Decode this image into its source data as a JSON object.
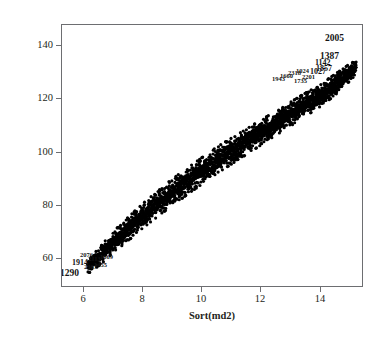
{
  "figure": {
    "background_color": "#ffffff",
    "frame_color": "#6d6e71",
    "point_color": "#000000"
  },
  "axes": {
    "x": {
      "label": "Sort(md2)",
      "ticks": [
        "6",
        "8",
        "10",
        "12",
        "14"
      ],
      "tick_values": [
        6,
        8,
        10,
        12,
        14
      ],
      "range": [
        5.28,
        15.45
      ]
    },
    "y": {
      "label": "Qchisq(((1:n)-(1/2))/n, (3 * k))",
      "ticks": [
        "140",
        "120",
        "100",
        "80",
        "60"
      ],
      "tick_values": [
        140,
        120,
        100,
        80,
        60
      ],
      "range": [
        50.1,
        148.9
      ]
    }
  },
  "point_labels": {
    "upper_right": [
      {
        "text": "2005",
        "x": 263,
        "y": 8,
        "size": "normal"
      },
      {
        "text": "1387",
        "x": 258,
        "y": 26,
        "size": "normal"
      },
      {
        "text": "1142",
        "x": 253,
        "y": 34,
        "size": "small"
      },
      {
        "text": "1857",
        "x": 254,
        "y": 40,
        "size": "small"
      },
      {
        "text": "1027",
        "x": 248,
        "y": 43,
        "size": "small"
      },
      {
        "text": "1024",
        "x": 234,
        "y": 42,
        "size": "tiny"
      },
      {
        "text": "2318",
        "x": 226,
        "y": 44,
        "size": "tiny"
      },
      {
        "text": "1660",
        "x": 218,
        "y": 47,
        "size": "tiny"
      },
      {
        "text": "1943",
        "x": 210,
        "y": 50,
        "size": "tiny"
      },
      {
        "text": "2201",
        "x": 240,
        "y": 48,
        "size": "tiny"
      },
      {
        "text": "1735",
        "x": 232,
        "y": 52,
        "size": "tiny"
      }
    ],
    "lower_left": [
      {
        "text": "1290",
        "x": -2,
        "y": 243,
        "size": "normal"
      },
      {
        "text": "1914",
        "x": 10,
        "y": 234,
        "size": "small"
      },
      {
        "text": "2076",
        "x": 18,
        "y": 226,
        "size": "tiny"
      },
      {
        "text": "2113",
        "x": 26,
        "y": 230,
        "size": "tiny"
      },
      {
        "text": "1455",
        "x": 32,
        "y": 236,
        "size": "tiny"
      },
      {
        "text": "2307",
        "x": 22,
        "y": 238,
        "size": "tiny"
      },
      {
        "text": "1669",
        "x": 38,
        "y": 228,
        "size": "tiny"
      }
    ]
  },
  "chart_data": {
    "type": "scatter",
    "title": "",
    "xlabel": "Sort(md2)",
    "ylabel": "Qchisq(((1:n)-(1/2))/n, (3 * k))",
    "xlim": [
      5.28,
      15.45
    ],
    "ylim": [
      50.1,
      148.9
    ],
    "grid": false,
    "legend": null,
    "n_points": 2400,
    "marker": "filled-circle",
    "marker_size_px": 3.2,
    "band": {
      "spine_x": [
        6.15,
        6.6,
        7.0,
        7.5,
        8.0,
        8.5,
        9.0,
        9.5,
        10.0,
        10.5,
        11.0,
        11.5,
        12.0,
        12.5,
        13.0,
        13.5,
        14.0,
        14.5,
        15.0,
        15.25
      ],
      "spine_y": [
        57.5,
        62.0,
        66.5,
        71.5,
        76.5,
        81.0,
        85.5,
        89.5,
        93.5,
        97.5,
        101.0,
        104.5,
        108.0,
        111.5,
        115.0,
        118.5,
        122.0,
        126.0,
        130.5,
        133.0
      ],
      "halfwidth_y": [
        3.0,
        3.6,
        4.0,
        4.4,
        4.6,
        4.8,
        5.0,
        5.0,
        5.0,
        5.0,
        4.9,
        4.8,
        4.7,
        4.6,
        4.5,
        4.4,
        4.2,
        4.0,
        3.4,
        2.6
      ]
    },
    "reference_points": [
      {
        "x": 6.2,
        "y": 58
      },
      {
        "x": 7.0,
        "y": 66
      },
      {
        "x": 8.0,
        "y": 77
      },
      {
        "x": 9.0,
        "y": 86
      },
      {
        "x": 10.0,
        "y": 94
      },
      {
        "x": 11.0,
        "y": 101
      },
      {
        "x": 12.0,
        "y": 108
      },
      {
        "x": 13.0,
        "y": 115
      },
      {
        "x": 14.0,
        "y": 122
      },
      {
        "x": 15.2,
        "y": 133
      }
    ]
  }
}
